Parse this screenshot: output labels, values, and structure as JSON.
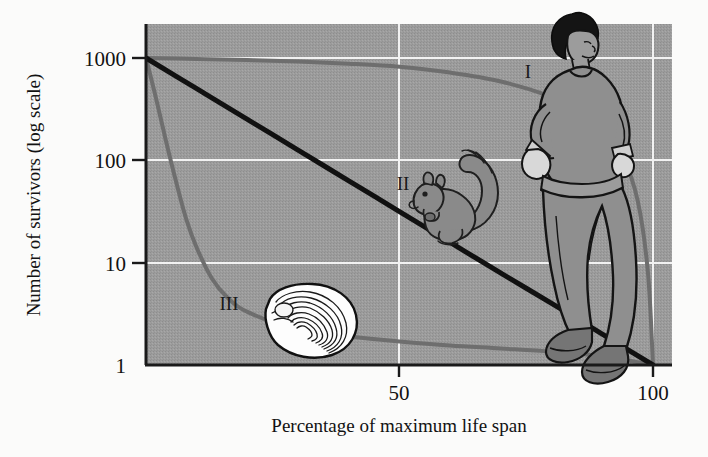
{
  "figure": {
    "kind": "survivorship-curves-figure",
    "background_color": "#fbfbfa",
    "plot_background_color": "#9c9c9c",
    "gridline_color": "#f2f2f2",
    "axis_color": "#1a1a1a"
  },
  "axes": {
    "y_title": "Number of survivors (log scale)",
    "x_title": "Percentage of maximum life span",
    "y_ticks": [
      "1000",
      "100",
      "10",
      "1"
    ],
    "x_ticks": [
      "50",
      "100"
    ]
  },
  "curve_labels": {
    "type_one": "I",
    "type_two": "II",
    "type_three": "III"
  },
  "illustrations": {
    "human": "human-jogger-illustration",
    "squirrel": "squirrel-illustration",
    "oyster": "oyster-shell-illustration"
  },
  "chart_data": {
    "type": "line",
    "title": "",
    "subtitle": "",
    "xlabel": "Percentage of maximum life span",
    "ylabel": "Number of survivors (log scale)",
    "xlim": [
      0,
      100
    ],
    "ylim": [
      1,
      1000
    ],
    "yscale": "log",
    "xticks": [
      50,
      100
    ],
    "yticks": [
      1,
      10,
      100,
      1000
    ],
    "grid": true,
    "grid_color": "#f2f2f2",
    "legend": "inline-curve-labels",
    "annotations": [
      {
        "text": "I",
        "x": 78,
        "y": 430,
        "note": "Type I survivorship, human jogger illustration"
      },
      {
        "text": "II",
        "x": 47,
        "y": 55,
        "note": "Type II survivorship, squirrel illustration"
      },
      {
        "text": "III",
        "x": 20,
        "y": 3.2,
        "note": "Type III survivorship, oyster shell illustration"
      }
    ],
    "series": [
      {
        "name": "Type I",
        "label": "I",
        "color": "#6e6e6e",
        "linewidth": 4,
        "x": [
          0,
          10,
          20,
          30,
          40,
          50,
          60,
          70,
          80,
          85,
          90,
          94,
          97,
          99,
          100
        ],
        "y": [
          1000,
          980,
          955,
          925,
          880,
          820,
          720,
          590,
          420,
          320,
          210,
          110,
          40,
          8,
          1
        ]
      },
      {
        "name": "Type II",
        "label": "II",
        "color": "#111111",
        "linewidth": 5,
        "x": [
          0,
          10,
          20,
          30,
          40,
          50,
          60,
          70,
          80,
          90,
          100
        ],
        "y": [
          1000,
          501,
          251,
          126,
          63,
          31.6,
          15.8,
          7.9,
          4.0,
          2.0,
          1
        ]
      },
      {
        "name": "Type III",
        "label": "III",
        "color": "#6e6e6e",
        "linewidth": 4,
        "x": [
          0,
          2,
          4,
          6,
          8,
          10,
          13,
          16,
          20,
          30,
          40,
          50,
          60,
          70,
          80,
          90,
          100
        ],
        "y": [
          1000,
          400,
          150,
          60,
          26,
          14,
          7.0,
          4.6,
          3.3,
          2.2,
          1.9,
          1.7,
          1.55,
          1.45,
          1.35,
          1.22,
          1
        ]
      }
    ]
  }
}
